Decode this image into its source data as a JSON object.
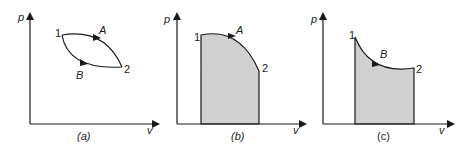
{
  "colors": {
    "line": "#1a1a1a",
    "fill": "#d0d0d0",
    "background": "#ffffff"
  },
  "panels": [
    {
      "id": "a",
      "caption": "(a)",
      "axis_y_label": "p",
      "axis_x_label": "v",
      "point_1_label": "1",
      "point_2_label": "2",
      "path_A_label": "A",
      "path_B_label": "B",
      "shaded": false
    },
    {
      "id": "b",
      "caption": "(b)",
      "axis_y_label": "p",
      "axis_x_label": "v",
      "point_1_label": "1",
      "point_2_label": "2",
      "path_A_label": "A",
      "shaded": true
    },
    {
      "id": "c",
      "caption": "(c)",
      "axis_y_label": "p",
      "axis_x_label": "v",
      "point_1_label": "1",
      "point_2_label": "2",
      "path_B_label": "B",
      "shaded": true
    }
  ]
}
